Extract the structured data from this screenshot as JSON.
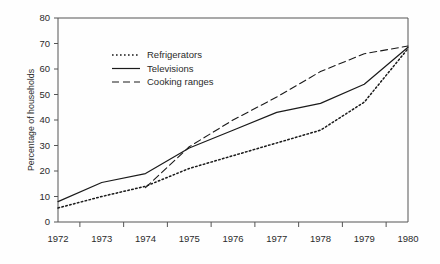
{
  "chart_data": {
    "type": "line",
    "title": "",
    "xlabel": "",
    "ylabel": "Percentage of households",
    "xlim": [
      1972,
      1980
    ],
    "ylim": [
      0,
      80
    ],
    "grid": false,
    "legend_position": "upper-left-inside",
    "x": [
      1972,
      1973,
      1974,
      1975,
      1976,
      1977,
      1978,
      1979,
      1980
    ],
    "categories": [
      "1972",
      "1973",
      "1974",
      "1975",
      "1976",
      "1977",
      "1978",
      "1979",
      "1980"
    ],
    "yticks": [
      0,
      10,
      20,
      30,
      40,
      50,
      60,
      70,
      80
    ],
    "ytick_labels": [
      "0",
      "10",
      "20",
      "30",
      "40",
      "50",
      "60",
      "70",
      "80"
    ],
    "series": [
      {
        "name": "Refrigerators",
        "style": "dotted",
        "color": "#1a1a1a",
        "x": [
          1972,
          1973,
          1974,
          1975,
          1976,
          1977,
          1978,
          1979,
          1980
        ],
        "values": [
          5.5,
          10,
          14,
          21,
          26,
          31,
          36,
          47,
          68
        ]
      },
      {
        "name": "Televisions",
        "style": "solid",
        "color": "#1a1a1a",
        "x": [
          1972,
          1973,
          1974,
          1975,
          1976,
          1977,
          1978,
          1979,
          1980
        ],
        "values": [
          8,
          15.5,
          19,
          29,
          36,
          43,
          46.5,
          54,
          68.5
        ]
      },
      {
        "name": "Cooking ranges",
        "style": "dashed",
        "color": "#1a1a1a",
        "x": [
          1974,
          1975,
          1976,
          1977,
          1978,
          1979,
          1980
        ],
        "values": [
          13.5,
          29.5,
          40,
          49,
          59,
          66,
          69
        ]
      }
    ]
  },
  "legend": {
    "items": [
      {
        "label": "Refrigerators",
        "style": "dotted"
      },
      {
        "label": "Televisions",
        "style": "solid"
      },
      {
        "label": "Cooking ranges",
        "style": "dashed"
      }
    ]
  },
  "axes": {
    "y_title": "Percentage of households"
  }
}
